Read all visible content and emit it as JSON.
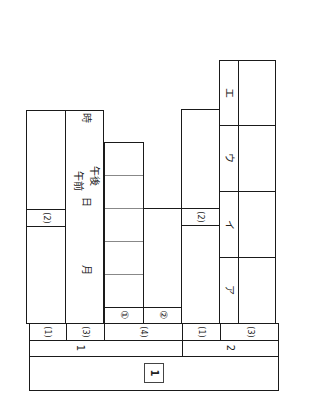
{
  "sheet": {
    "section_header": "1",
    "groups": [
      {
        "label": "1",
        "items": [
          {
            "label": "(1)"
          },
          {
            "label": "(2)"
          },
          {
            "label": "(3)",
            "date_fields": {
              "month": "月",
              "day": "日",
              "am": "午前",
              "pm": "午後",
              "hour": "時"
            }
          },
          {
            "label": "(4)",
            "sub_items": [
              {
                "label": "①"
              },
              {
                "label": "②"
              }
            ]
          }
        ]
      },
      {
        "label": "2",
        "items": [
          {
            "label": "(1)"
          },
          {
            "label": "(2)"
          },
          {
            "label": "(3)",
            "choices": [
              "ア",
              "イ",
              "ウ",
              "エ"
            ]
          }
        ]
      }
    ]
  }
}
